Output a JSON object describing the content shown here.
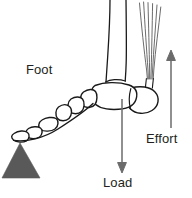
{
  "figure": {
    "background_color": "#ffffff",
    "line_color": "#1a1a1a",
    "arrow_color": "#6b6b6b",
    "fulcrum_color": "#595959",
    "text_color": "#231f20"
  },
  "labels": {
    "foot": "Foot",
    "effort": "Effort",
    "load": "Load"
  },
  "annotations": [
    {
      "name": "foot-label",
      "text": "Foot",
      "x": 26,
      "y": 62,
      "points_to": "foot-skeleton"
    },
    {
      "name": "effort-label",
      "text": "Effort",
      "x": 146,
      "y": 131,
      "points_to": "effort-arrow",
      "arrow_direction": "up"
    },
    {
      "name": "load-label",
      "text": "Load",
      "x": 103,
      "y": 175,
      "points_to": "load-arrow",
      "arrow_direction": "down"
    }
  ],
  "arrows": {
    "effort": {
      "direction": "up",
      "x": 171,
      "y_start": 128,
      "y_end": 52,
      "color": "#6b6b6b"
    },
    "load": {
      "direction": "down",
      "x": 122,
      "y_start": 99,
      "y_end": 172,
      "color": "#6b6b6b"
    }
  },
  "parts": [
    {
      "name": "tibia",
      "label": "leg bone (tibia)"
    },
    {
      "name": "fibula",
      "label": "leg bone (fibula)"
    },
    {
      "name": "achilles-tendon",
      "label": "tendon fibers"
    },
    {
      "name": "calcaneus",
      "label": "heel bone"
    },
    {
      "name": "tarsal-bones",
      "label": "tarsal bones"
    },
    {
      "name": "metatarsal-bones",
      "label": "metatarsal bones"
    },
    {
      "name": "phalanges",
      "label": "toe bones"
    },
    {
      "name": "fulcrum",
      "label": "fulcrum (triangle)"
    }
  ]
}
